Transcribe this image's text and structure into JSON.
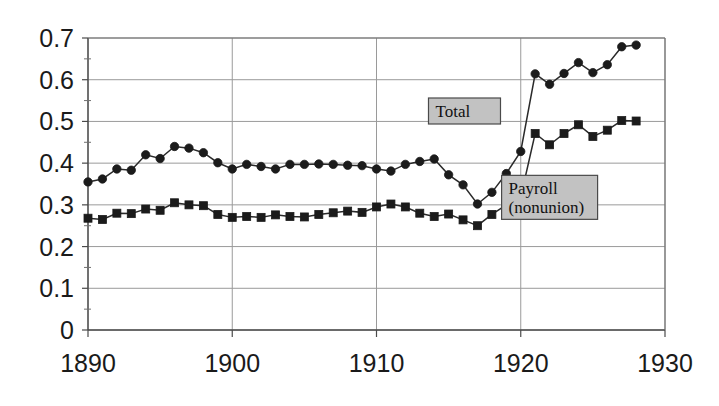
{
  "chart_data": {
    "type": "line",
    "title": "",
    "subtitle": "",
    "xlabel": "",
    "ylabel": "",
    "xlim": [
      1890,
      1930
    ],
    "ylim": [
      0,
      0.7
    ],
    "grid": true,
    "legend_position": "inside-plot",
    "x_ticks": [
      "1890",
      "1900",
      "1910",
      "1920",
      "1930"
    ],
    "x_tick_values": [
      1890,
      1900,
      1910,
      1920,
      1930
    ],
    "y_ticks": [
      "0",
      "0.1",
      "0.2",
      "0.3",
      "0.4",
      "0.5",
      "0.6",
      "0.7"
    ],
    "y_tick_values": [
      0,
      0.1,
      0.2,
      0.3,
      0.4,
      0.5,
      0.6,
      0.7
    ],
    "x": [
      1890,
      1891,
      1892,
      1893,
      1894,
      1895,
      1896,
      1897,
      1898,
      1899,
      1900,
      1901,
      1902,
      1903,
      1904,
      1905,
      1906,
      1907,
      1908,
      1909,
      1910,
      1911,
      1912,
      1913,
      1914,
      1915,
      1916,
      1917,
      1918,
      1919,
      1920,
      1921,
      1922,
      1923,
      1924,
      1925,
      1926,
      1927,
      1928
    ],
    "series": [
      {
        "name": "Total",
        "marker": "circle",
        "values": [
          0.355,
          0.362,
          0.386,
          0.383,
          0.42,
          0.411,
          0.44,
          0.436,
          0.425,
          0.401,
          0.386,
          0.397,
          0.392,
          0.386,
          0.397,
          0.397,
          0.398,
          0.397,
          0.395,
          0.394,
          0.386,
          0.381,
          0.397,
          0.404,
          0.41,
          0.372,
          0.348,
          0.302,
          0.33,
          0.375,
          0.428,
          0.614,
          0.589,
          0.615,
          0.641,
          0.617,
          0.636,
          0.679,
          0.683
        ]
      },
      {
        "name": "Payroll (nonunion)",
        "marker": "square",
        "values": [
          0.268,
          0.265,
          0.28,
          0.279,
          0.29,
          0.287,
          0.305,
          0.3,
          0.298,
          0.277,
          0.27,
          0.272,
          0.27,
          0.276,
          0.272,
          0.271,
          0.277,
          0.281,
          0.285,
          0.282,
          0.295,
          0.302,
          0.295,
          0.28,
          0.272,
          0.278,
          0.264,
          0.25,
          0.277,
          0.3,
          0.319,
          0.471,
          0.444,
          0.471,
          0.492,
          0.464,
          0.479,
          0.502,
          0.501
        ]
      }
    ],
    "annotations": [
      {
        "label": "Total",
        "x": 1916.1,
        "y": 0.525,
        "width": 72,
        "height": 26
      },
      {
        "label": "Payroll\n(nonunion)",
        "x": 1922.0,
        "y": 0.318,
        "width": 96,
        "height": 44
      }
    ]
  },
  "legend_labels": {
    "total": "Total",
    "payroll_line1": "Payroll",
    "payroll_line2": "(nonunion)"
  },
  "colors": {
    "marker": "#1b1b1b",
    "line": "#2a2a2a",
    "grid": "#9a9a9a",
    "axis": "#4a4a4a",
    "legend_fill": "#c2c2c2",
    "legend_border": "#4a4a4a",
    "text": "#1a1a1a",
    "background": "#ffffff"
  }
}
